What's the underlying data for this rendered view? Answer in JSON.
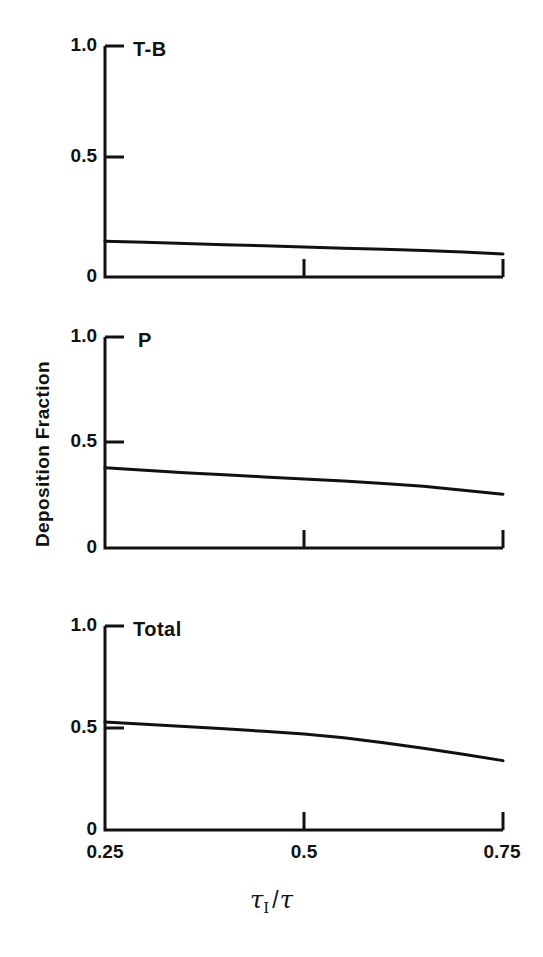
{
  "figure": {
    "ylabel": "Deposition Fraction",
    "xlabel_num": "τ",
    "xlabel_sub": "I",
    "xlabel_slash": "/",
    "xlabel_den": "τ",
    "line_color": "#111111",
    "background": "#ffffff"
  },
  "axes": {
    "ytick_labels": [
      "1.0",
      "0.5",
      "0"
    ],
    "xtick_labels": [
      "0.25",
      "0.5",
      "0.75"
    ]
  },
  "chart_data": [
    {
      "type": "line",
      "title": "T-B",
      "xlabel": "τI/τ",
      "ylabel": "Deposition Fraction",
      "xlim": [
        0.25,
        0.75
      ],
      "ylim": [
        0.0,
        1.0
      ],
      "xticks": [
        0.25,
        0.5,
        0.75
      ],
      "yticks": [
        0.0,
        0.5,
        1.0
      ],
      "grid": false,
      "legend": false,
      "x": [
        0.25,
        0.3,
        0.35,
        0.4,
        0.45,
        0.5,
        0.55,
        0.6,
        0.65,
        0.7,
        0.75
      ],
      "values": [
        0.155,
        0.15,
        0.145,
        0.14,
        0.135,
        0.13,
        0.125,
        0.12,
        0.115,
        0.108,
        0.1
      ]
    },
    {
      "type": "line",
      "title": "P",
      "xlabel": "τI/τ",
      "ylabel": "Deposition Fraction",
      "xlim": [
        0.25,
        0.75
      ],
      "ylim": [
        0.0,
        1.0
      ],
      "xticks": [
        0.25,
        0.5,
        0.75
      ],
      "yticks": [
        0.0,
        0.5,
        1.0
      ],
      "grid": false,
      "legend": false,
      "x": [
        0.25,
        0.3,
        0.35,
        0.4,
        0.45,
        0.5,
        0.55,
        0.6,
        0.65,
        0.7,
        0.75
      ],
      "values": [
        0.38,
        0.368,
        0.357,
        0.347,
        0.337,
        0.327,
        0.317,
        0.306,
        0.293,
        0.274,
        0.255
      ]
    },
    {
      "type": "line",
      "title": "Total",
      "xlabel": "τI/τ",
      "ylabel": "Deposition Fraction",
      "xlim": [
        0.25,
        0.75
      ],
      "ylim": [
        0.0,
        1.0
      ],
      "xticks": [
        0.25,
        0.5,
        0.75
      ],
      "yticks": [
        0.0,
        0.5,
        1.0
      ],
      "grid": false,
      "legend": false,
      "x": [
        0.25,
        0.3,
        0.35,
        0.4,
        0.45,
        0.5,
        0.55,
        0.6,
        0.65,
        0.7,
        0.75
      ],
      "values": [
        0.53,
        0.518,
        0.507,
        0.496,
        0.484,
        0.47,
        0.452,
        0.428,
        0.401,
        0.371,
        0.34
      ]
    }
  ]
}
